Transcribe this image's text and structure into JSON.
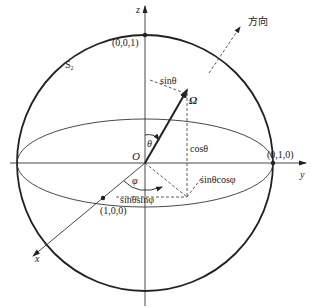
{
  "figure": {
    "type": "unit-sphere-coordinate-diagram",
    "sphere_label": "S",
    "sphere_label_sub": "2",
    "axes": {
      "x": "x",
      "y": "y",
      "z": "z"
    },
    "origin_label": "O",
    "points": {
      "north": "(0,0,1)",
      "y_unit": "(0,1,0)",
      "x_unit": "(1,0,0)"
    },
    "vector_label": "Ω",
    "direction_label": "方向",
    "angles": {
      "theta": "θ",
      "phi": "φ"
    },
    "components": {
      "sin_theta": "sinθ",
      "cos_theta": "cosθ",
      "sin_theta_cos_phi": "sinθcosφ",
      "sin_theta_sin_phi": "sinθsinφ"
    },
    "colors": {
      "stroke": "#222222",
      "background": "#ffffff"
    }
  }
}
